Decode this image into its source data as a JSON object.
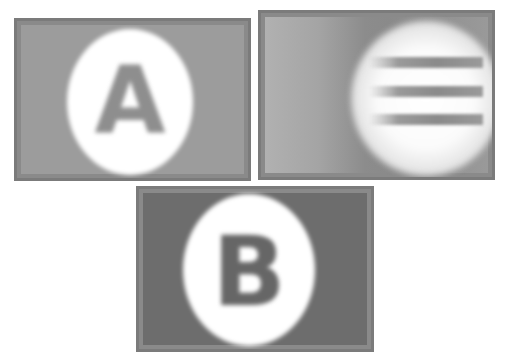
{
  "figure": {
    "panels": [
      {
        "id": "panel-a",
        "label": "A",
        "description": "blurred letter inside white oval on mid-gray background",
        "background": "#9c9c9c",
        "letter_color": "#8e8e8e"
      },
      {
        "id": "panel-stripes",
        "label": "",
        "description": "three horizontal gray bars over a white glow on a gray gradient",
        "stripe_count": 3,
        "background": "#9a9a9a"
      },
      {
        "id": "panel-b",
        "label": "B",
        "description": "blurred letter inside white oval on dark-gray background",
        "background": "#6d6d6d",
        "letter_color": "#666666"
      }
    ],
    "caption": {
      "text": "",
      "note": "caption line clipped at bottom edge; text not legible"
    }
  }
}
